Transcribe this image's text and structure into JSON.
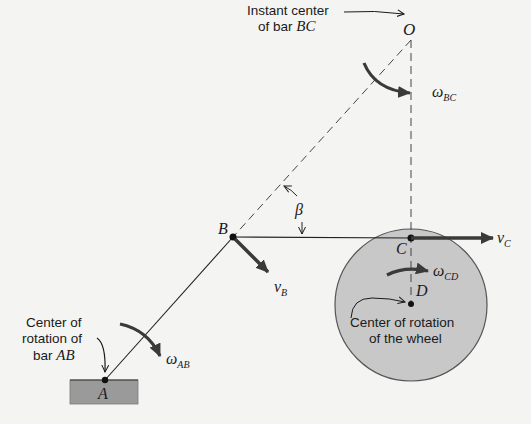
{
  "diagram": {
    "points": {
      "O": {
        "label": "O"
      },
      "A": {
        "label": "A"
      },
      "B": {
        "label": "B"
      },
      "C": {
        "label": "C"
      },
      "D": {
        "label": "D"
      }
    },
    "annotations": {
      "instant_center_line1": "Instant center",
      "instant_center_line2_prefix": "of bar ",
      "instant_center_line2_var": "BC",
      "center_ab_line1": "Center of",
      "center_ab_line2": "rotation of",
      "center_ab_line3_prefix": "bar ",
      "center_ab_line3_var": "AB",
      "wheel_center_line1": "Center of rotation",
      "wheel_center_line2": "of the wheel"
    },
    "angle": {
      "symbol": "β"
    },
    "angular_velocities": {
      "omega_bc": {
        "symbol": "ω",
        "sub": "BC"
      },
      "omega_ab": {
        "symbol": "ω",
        "sub": "AB"
      },
      "omega_cd": {
        "symbol": "ω",
        "sub": "CD"
      }
    },
    "velocities": {
      "v_b": {
        "symbol": "v",
        "sub": "B"
      },
      "v_c": {
        "symbol": "v",
        "sub": "C"
      }
    },
    "colors": {
      "background": "#f4f4f3",
      "wheel_fill": "#c8c8c8",
      "ground_fill": "#9a9a9a",
      "ink": "#1a1a1a",
      "arrow_ink": "#3a3a3a"
    }
  }
}
